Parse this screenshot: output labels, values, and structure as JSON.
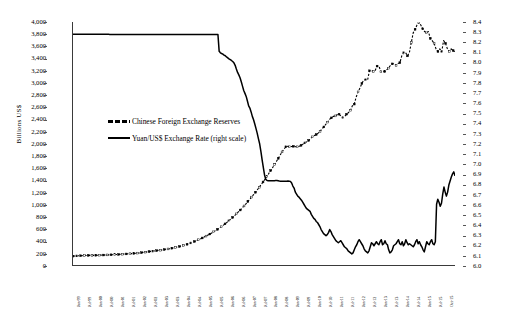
{
  "chart_data": {
    "type": "line",
    "title": "",
    "xlabel": "",
    "ylabel": "Billions US$",
    "y2label": "",
    "ylim": [
      0,
      4000
    ],
    "y2lim": [
      6.0,
      8.4
    ],
    "grid": false,
    "legend_position": "inside-left",
    "y_ticks": [
      "0",
      "200",
      "400",
      "600",
      "800",
      "1,000",
      "1,200",
      "1,400",
      "1,600",
      "1,800",
      "2,000",
      "2,200",
      "2,400",
      "2,600",
      "2,800",
      "3,000",
      "3,200",
      "3,400",
      "3,600",
      "3,800",
      "4,000"
    ],
    "y2_ticks": [
      "6.0",
      "6.1",
      "6.2",
      "6.3",
      "6.4",
      "6.5",
      "6.6",
      "6.7",
      "6.8",
      "6.9",
      "7.0",
      "7.1",
      "7.2",
      "7.3",
      "7.4",
      "7.5",
      "7.6",
      "7.7",
      "7.8",
      "7.9",
      "8.0",
      "8.1",
      "8.2",
      "8.3",
      "8.4"
    ],
    "x_tick_labels": [
      "Jan-99",
      "Jul-99",
      "Jan-00",
      "Jul-00",
      "Jan-01",
      "Jul-01",
      "Jan-02",
      "Jul-02",
      "Jan-03",
      "Jul-03",
      "Jan-04",
      "Jul-04",
      "Jan-05",
      "Jul-05",
      "Jan-06",
      "Jul-06",
      "Jan-07",
      "Jul-07",
      "Jan-08",
      "Jul-08",
      "Jan-09",
      "Jul-09",
      "Jan-10",
      "Jul-10",
      "Jan-11",
      "Jul-11",
      "Jan-12",
      "Jul-12",
      "Jan-13",
      "Jul-13",
      "Jan-14",
      "Jul-14",
      "Jan-15",
      "Jul-15",
      "Oct-15"
    ],
    "series": [
      {
        "name": "Chinese Foreign Exchange Reserves",
        "style": "dashed-markers",
        "axis": "left",
        "units": "Billions US$",
        "values": [
          146,
          148,
          150,
          152,
          153,
          155,
          156,
          157,
          158,
          159,
          158,
          159,
          160,
          161,
          162,
          163,
          164,
          165,
          166,
          167,
          168,
          169,
          170,
          172,
          174,
          176,
          178,
          180,
          182,
          184,
          186,
          188,
          190,
          193,
          196,
          199,
          203,
          207,
          212,
          216,
          220,
          224,
          228,
          232,
          236,
          240,
          244,
          249,
          254,
          259,
          264,
          270,
          276,
          283,
          290,
          297,
          305,
          313,
          322,
          331,
          341,
          352,
          363,
          375,
          388,
          402,
          416,
          430,
          445,
          460,
          476,
          492,
          509,
          527,
          546,
          566,
          587,
          608,
          630,
          653,
          677,
          702,
          728,
          755,
          783,
          812,
          842,
          873,
          905,
          938,
          972,
          1007,
          1043,
          1080,
          1118,
          1157,
          1197,
          1238,
          1280,
          1323,
          1367,
          1412,
          1458,
          1505,
          1553,
          1602,
          1652,
          1703,
          1755,
          1808,
          1862,
          1906,
          1946,
          1953,
          1946,
          1950,
          1954,
          1949,
          1946,
          1954,
          1970,
          1990,
          2010,
          2030,
          2050,
          2080,
          2110,
          2132,
          2148,
          2170,
          2200,
          2240,
          2273,
          2316,
          2352,
          2399,
          2422,
          2447,
          2454,
          2474,
          2483,
          2454,
          2425,
          2447,
          2483,
          2510,
          2548,
          2620,
          2648,
          2764,
          2850,
          2914,
          2989,
          3044,
          3050,
          3045,
          3197,
          3201,
          3185,
          3202,
          3274,
          3273,
          3181,
          3182,
          3184,
          3212,
          3240,
          3285,
          3311,
          3312,
          3285,
          3316,
          3331,
          3443,
          3495,
          3497,
          3442,
          3496,
          3661,
          3821,
          3880,
          3950,
          3993,
          3950,
          3888,
          3843,
          3821,
          3843,
          3730,
          3694,
          3651,
          3557,
          3514,
          3557,
          3510,
          3694,
          3651,
          3557,
          3514,
          3557,
          3530,
          3514
        ]
      },
      {
        "name": "Yuan/US$ Exchange Rate (right scale)",
        "style": "solid",
        "axis": "right",
        "units": "Yuan per US$",
        "values": [
          8.279,
          8.279,
          8.279,
          8.279,
          8.279,
          8.279,
          8.279,
          8.279,
          8.279,
          8.279,
          8.279,
          8.279,
          8.279,
          8.279,
          8.279,
          8.279,
          8.279,
          8.279,
          8.279,
          8.279,
          8.278,
          8.278,
          8.278,
          8.278,
          8.278,
          8.278,
          8.278,
          8.278,
          8.278,
          8.278,
          8.277,
          8.277,
          8.277,
          8.277,
          8.277,
          8.277,
          8.277,
          8.277,
          8.277,
          8.277,
          8.277,
          8.277,
          8.277,
          8.277,
          8.277,
          8.277,
          8.277,
          8.277,
          8.277,
          8.277,
          8.277,
          8.277,
          8.277,
          8.277,
          8.277,
          8.277,
          8.277,
          8.277,
          8.277,
          8.277,
          8.277,
          8.277,
          8.277,
          8.277,
          8.277,
          8.277,
          8.277,
          8.277,
          8.277,
          8.277,
          8.277,
          8.277,
          8.277,
          8.277,
          8.277,
          8.277,
          8.277,
          8.277,
          8.277,
          8.277,
          8.277,
          8.277,
          8.277,
          8.277,
          8.277,
          8.277,
          8.277,
          8.277,
          8.277,
          8.277,
          8.277,
          8.277,
          8.277,
          8.277,
          8.277,
          8.277,
          8.277,
          8.277,
          8.277,
          8.277,
          8.277,
          8.277,
          8.277,
          8.277,
          8.277,
          8.277,
          8.277,
          8.277,
          8.277,
          8.277,
          8.277,
          8.277,
          8.277,
          8.277,
          8.277,
          8.277,
          8.277,
          8.277,
          8.277,
          8.11,
          8.096,
          8.089,
          8.083,
          8.073,
          8.067,
          8.055,
          8.046,
          8.036,
          8.028,
          8.02,
          8.01,
          7.997,
          7.972,
          7.935,
          7.902,
          7.878,
          7.85,
          7.81,
          7.767,
          7.723,
          7.695,
          7.665,
          7.62,
          7.572,
          7.55,
          7.512,
          7.468,
          7.435,
          7.392,
          7.347,
          7.3,
          7.245,
          7.195,
          7.12,
          7.035,
          6.96,
          6.885,
          6.845,
          6.835,
          6.833,
          6.833,
          6.833,
          6.833,
          6.833,
          6.833,
          6.834,
          6.835,
          6.833,
          6.83,
          6.828,
          6.827,
          6.826,
          6.826,
          6.827,
          6.828,
          6.83,
          6.828,
          6.826,
          6.81,
          6.78,
          6.76,
          6.72,
          6.7,
          6.68,
          6.67,
          6.655,
          6.64,
          6.62,
          6.6,
          6.58,
          6.56,
          6.55,
          6.54,
          6.53,
          6.5,
          6.48,
          6.46,
          6.45,
          6.43,
          6.42,
          6.4,
          6.38,
          6.35,
          6.33,
          6.31,
          6.3,
          6.29,
          6.3,
          6.32,
          6.35,
          6.33,
          6.3,
          6.28,
          6.26,
          6.24,
          6.23,
          6.22,
          6.23,
          6.24,
          6.22,
          6.2,
          6.18,
          6.17,
          6.16,
          6.14,
          6.13,
          6.12,
          6.11,
          6.12,
          6.15,
          6.18,
          6.2,
          6.23,
          6.25,
          6.23,
          6.21,
          6.19,
          6.16,
          6.14,
          6.13,
          6.12,
          6.14,
          6.18,
          6.22,
          6.21,
          6.19,
          6.21,
          6.23,
          6.21,
          6.2,
          6.23,
          6.25,
          6.2,
          6.21,
          6.24,
          6.21,
          6.2,
          6.15,
          6.12,
          6.13,
          6.15,
          6.19,
          6.2,
          6.21,
          6.23,
          6.25,
          6.21,
          6.2,
          6.23,
          6.19,
          6.21,
          6.25,
          6.22,
          6.2,
          6.21,
          6.2,
          6.19,
          6.18,
          6.2,
          6.23,
          6.25,
          6.21,
          6.23,
          6.2,
          6.18,
          6.15,
          6.13,
          6.18,
          6.23,
          6.21,
          6.2,
          6.23,
          6.25,
          6.21,
          6.2,
          6.23,
          6.6,
          6.65,
          6.62,
          6.58,
          6.61,
          6.7,
          6.77,
          6.72,
          6.68,
          6.72,
          6.79,
          6.83,
          6.87,
          6.9,
          6.92,
          6.88
        ]
      }
    ]
  },
  "legend": {
    "items": [
      {
        "label": "Chinese Foreign Exchange Reserves",
        "key": "dash"
      },
      {
        "label": "Yuan/US$ Exchange Rate (right scale)",
        "key": "solid"
      }
    ]
  },
  "axis_titles": {
    "left": "Billions US$"
  }
}
